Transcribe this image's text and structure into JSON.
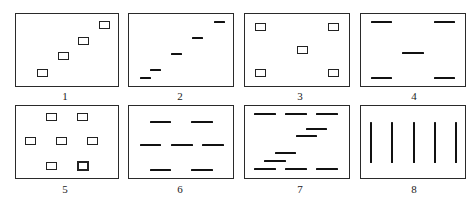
{
  "figure": {
    "panels": [
      {
        "id": 1,
        "label": "1",
        "kind": "boxes",
        "description": "four squares on rising diagonal"
      },
      {
        "id": 2,
        "label": "2",
        "kind": "dashes",
        "description": "five short dashes on rising diagonal"
      },
      {
        "id": 3,
        "label": "3",
        "kind": "boxes",
        "description": "five squares: four corners plus center"
      },
      {
        "id": 4,
        "label": "4",
        "kind": "dashes",
        "description": "five dashes: four corners plus center"
      },
      {
        "id": 5,
        "label": "5",
        "kind": "boxes",
        "description": "seven squares in hexagonal arrangement, one bold"
      },
      {
        "id": 6,
        "label": "6",
        "kind": "dashes",
        "description": "seven dashes in 2-3-2 rows"
      },
      {
        "id": 7,
        "label": "7",
        "kind": "dashes",
        "description": "three-dash rows top and bottom with diagonal dashes between"
      },
      {
        "id": 8,
        "label": "8",
        "kind": "vertical-bars",
        "description": "five evenly spaced vertical bars"
      }
    ]
  }
}
